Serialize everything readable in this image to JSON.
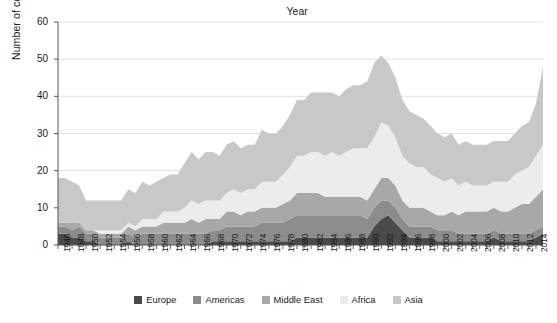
{
  "chart_data": {
    "type": "area",
    "stacked": true,
    "title": "",
    "xlabel": "Year",
    "ylabel": "Number of conflicts",
    "xlim": [
      1946,
      2015
    ],
    "ylim": [
      0,
      60
    ],
    "yticks": [
      0,
      10,
      20,
      30,
      40,
      50,
      60
    ],
    "grid": "horizontal",
    "legend_position": "bottom",
    "legend_entries": [
      "Europe",
      "Americas",
      "Middle East",
      "Africa",
      "Asia"
    ],
    "x": [
      1946,
      1947,
      1948,
      1949,
      1950,
      1951,
      1952,
      1953,
      1954,
      1955,
      1956,
      1957,
      1958,
      1959,
      1960,
      1961,
      1962,
      1963,
      1964,
      1965,
      1966,
      1967,
      1968,
      1969,
      1970,
      1971,
      1972,
      1973,
      1974,
      1975,
      1976,
      1977,
      1978,
      1979,
      1980,
      1981,
      1982,
      1983,
      1984,
      1985,
      1986,
      1987,
      1988,
      1989,
      1990,
      1991,
      1992,
      1993,
      1994,
      1995,
      1996,
      1997,
      1998,
      1999,
      2000,
      2001,
      2002,
      2003,
      2004,
      2005,
      2006,
      2007,
      2008,
      2009,
      2010,
      2011,
      2012,
      2013,
      2014,
      2015
    ],
    "series": [
      {
        "name": "Europe",
        "color": "#4a4a4a",
        "values": [
          3,
          3,
          2,
          2,
          1,
          1,
          0,
          0,
          0,
          0,
          1,
          0,
          0,
          0,
          0,
          0,
          0,
          0,
          0,
          0,
          0,
          0,
          1,
          1,
          1,
          1,
          1,
          1,
          1,
          1,
          1,
          1,
          1,
          1,
          2,
          2,
          2,
          2,
          2,
          2,
          2,
          2,
          2,
          2,
          2,
          5,
          7,
          8,
          6,
          4,
          2,
          2,
          2,
          2,
          1,
          1,
          1,
          1,
          1,
          1,
          1,
          1,
          2,
          1,
          1,
          1,
          1,
          1,
          2,
          3
        ]
      },
      {
        "name": "Americas",
        "color": "#8c8c8c",
        "values": [
          2,
          2,
          2,
          3,
          2,
          2,
          2,
          2,
          2,
          2,
          2,
          2,
          3,
          3,
          3,
          3,
          3,
          3,
          3,
          3,
          3,
          3,
          3,
          3,
          4,
          4,
          4,
          4,
          4,
          5,
          5,
          5,
          5,
          6,
          6,
          6,
          6,
          6,
          6,
          6,
          6,
          6,
          6,
          6,
          5,
          5,
          5,
          4,
          4,
          3,
          3,
          3,
          3,
          3,
          3,
          3,
          3,
          2,
          2,
          2,
          2,
          2,
          2,
          2,
          2,
          2,
          2,
          2,
          2,
          2
        ]
      },
      {
        "name": "Middle East",
        "color": "#a8a8a8",
        "values": [
          1,
          1,
          2,
          1,
          1,
          1,
          1,
          1,
          1,
          1,
          2,
          2,
          2,
          2,
          2,
          3,
          3,
          3,
          3,
          4,
          3,
          4,
          3,
          3,
          4,
          4,
          3,
          4,
          4,
          4,
          4,
          4,
          5,
          5,
          6,
          6,
          6,
          6,
          5,
          5,
          5,
          5,
          5,
          5,
          5,
          5,
          6,
          6,
          6,
          5,
          5,
          5,
          5,
          4,
          4,
          4,
          5,
          5,
          6,
          6,
          6,
          6,
          6,
          6,
          6,
          7,
          8,
          8,
          9,
          10
        ]
      },
      {
        "name": "Africa",
        "color": "#ececec",
        "values": [
          0,
          0,
          0,
          0,
          0,
          0,
          1,
          1,
          1,
          1,
          1,
          1,
          2,
          2,
          2,
          3,
          3,
          3,
          4,
          5,
          5,
          5,
          5,
          5,
          5,
          6,
          6,
          6,
          6,
          7,
          7,
          7,
          8,
          9,
          10,
          10,
          11,
          11,
          11,
          12,
          11,
          12,
          13,
          13,
          14,
          14,
          15,
          14,
          13,
          12,
          12,
          11,
          11,
          10,
          10,
          9,
          9,
          8,
          8,
          7,
          7,
          7,
          7,
          8,
          8,
          9,
          9,
          10,
          11,
          12
        ]
      },
      {
        "name": "Asia",
        "color": "#c8c8c8",
        "values": [
          12,
          12,
          11,
          10,
          8,
          8,
          8,
          8,
          8,
          8,
          9,
          9,
          10,
          9,
          10,
          9,
          10,
          10,
          12,
          13,
          12,
          13,
          13,
          12,
          13,
          13,
          12,
          12,
          12,
          14,
          13,
          13,
          13,
          14,
          15,
          15,
          16,
          16,
          17,
          16,
          16,
          17,
          17,
          17,
          18,
          20,
          18,
          17,
          16,
          15,
          14,
          14,
          13,
          13,
          12,
          12,
          12,
          11,
          11,
          11,
          11,
          11,
          11,
          11,
          11,
          11,
          12,
          12,
          14,
          21
        ]
      }
    ],
    "totals": [
      18,
      18,
      17,
      16,
      12,
      12,
      12,
      12,
      12,
      12,
      15,
      14,
      17,
      16,
      17,
      18,
      19,
      19,
      22,
      25,
      23,
      25,
      25,
      24,
      27,
      28,
      26,
      27,
      27,
      31,
      30,
      30,
      32,
      35,
      39,
      39,
      41,
      41,
      41,
      41,
      40,
      42,
      43,
      43,
      44,
      49,
      51,
      49,
      45,
      39,
      36,
      35,
      34,
      32,
      30,
      29,
      30,
      27,
      28,
      27,
      27,
      27,
      28,
      28,
      28,
      30,
      32,
      33,
      38,
      48
    ]
  },
  "legend": {
    "items": [
      {
        "label": "Europe",
        "color": "#4a4a4a"
      },
      {
        "label": "Americas",
        "color": "#8c8c8c"
      },
      {
        "label": "Middle East",
        "color": "#a8a8a8"
      },
      {
        "label": "Africa",
        "color": "#ececec"
      },
      {
        "label": "Asia",
        "color": "#c8c8c8"
      }
    ]
  },
  "axes": {
    "y_title": "Number of conflicts",
    "x_title": "Year",
    "y_tick_labels": [
      "0",
      "10",
      "20",
      "30",
      "40",
      "50",
      "60"
    ],
    "x_tick_labels": [
      "1946",
      "1948",
      "1950",
      "1952",
      "1954",
      "1956",
      "1958",
      "1960",
      "1962",
      "1964",
      "1966",
      "1968",
      "1970",
      "1972",
      "1974",
      "1976",
      "1978",
      "1980",
      "1982",
      "1984",
      "1986",
      "1988",
      "1990",
      "1992",
      "1994",
      "1996",
      "1998",
      "2000",
      "2002",
      "2004",
      "2006",
      "2008",
      "2010",
      "2012",
      "2014"
    ]
  }
}
